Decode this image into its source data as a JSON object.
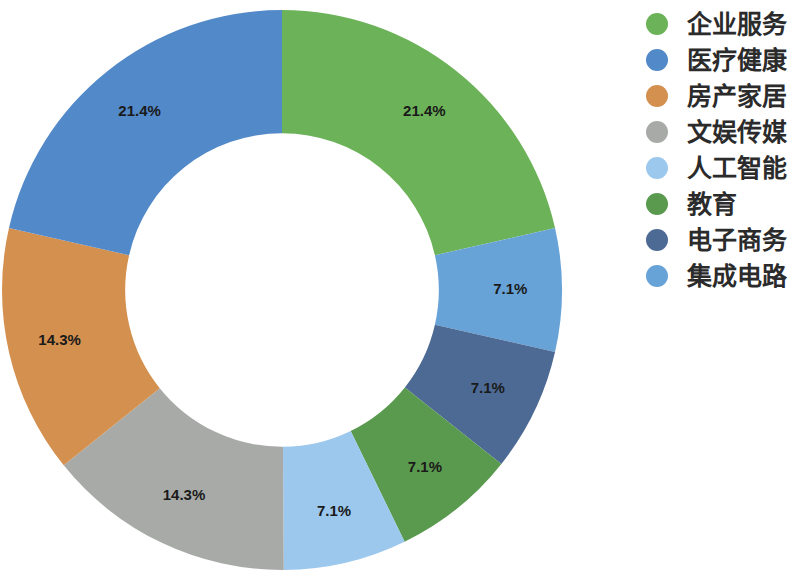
{
  "chart_data": {
    "type": "pie",
    "variant": "donut",
    "title": "",
    "subtitle": "",
    "xlabel": "",
    "ylabel": "",
    "legend_position": "right",
    "grid": false,
    "value_unit": "%",
    "label_format": "{value}%",
    "start_angle_deg": -90,
    "direction": "clockwise",
    "inner_radius_ratio": 0.56,
    "categories": [
      "企业服务",
      "医疗健康",
      "房产家居",
      "文娱传媒",
      "人工智能",
      "教育",
      "电子商务",
      "集成电路"
    ],
    "values": [
      21.4,
      21.4,
      14.3,
      14.3,
      7.1,
      7.1,
      7.1,
      7.1
    ],
    "labels": [
      "21.4%",
      "21.4%",
      "14.3%",
      "14.3%",
      "7.1%",
      "7.1%",
      "7.1%",
      "7.1%"
    ],
    "colors": [
      "#6cb259",
      "#5289c9",
      "#d4904f",
      "#a8aaa8",
      "#9cc8ed",
      "#5a9a4f",
      "#4d6a94",
      "#68a3d8"
    ],
    "draw_order": [
      {
        "category": "企业服务",
        "value": 21.4,
        "label": "21.4%",
        "color": "#6cb259"
      },
      {
        "category": "集成电路",
        "value": 7.1,
        "label": "7.1%",
        "color": "#68a3d8"
      },
      {
        "category": "电子商务",
        "value": 7.1,
        "label": "7.1%",
        "color": "#4d6a94"
      },
      {
        "category": "教育",
        "value": 7.1,
        "label": "7.1%",
        "color": "#5a9a4f"
      },
      {
        "category": "人工智能",
        "value": 7.1,
        "label": "7.1%",
        "color": "#9cc8ed"
      },
      {
        "category": "文娱传媒",
        "value": 14.3,
        "label": "14.3%",
        "color": "#a8aaa8"
      },
      {
        "category": "房产家居",
        "value": 14.3,
        "label": "14.3%",
        "color": "#d4904f"
      },
      {
        "category": "医疗健康",
        "value": 21.4,
        "label": "21.4%",
        "color": "#5289c9"
      }
    ]
  },
  "legend": {
    "items": [
      {
        "label": "企业服务",
        "color": "#6cb259"
      },
      {
        "label": "医疗健康",
        "color": "#5289c9"
      },
      {
        "label": "房产家居",
        "color": "#d4904f"
      },
      {
        "label": "文娱传媒",
        "color": "#a8aaa8"
      },
      {
        "label": "人工智能",
        "color": "#9cc8ed"
      },
      {
        "label": "教育",
        "color": "#5a9a4f"
      },
      {
        "label": "电子商务",
        "color": "#4d6a94"
      },
      {
        "label": "集成电路",
        "color": "#68a3d8"
      }
    ]
  }
}
